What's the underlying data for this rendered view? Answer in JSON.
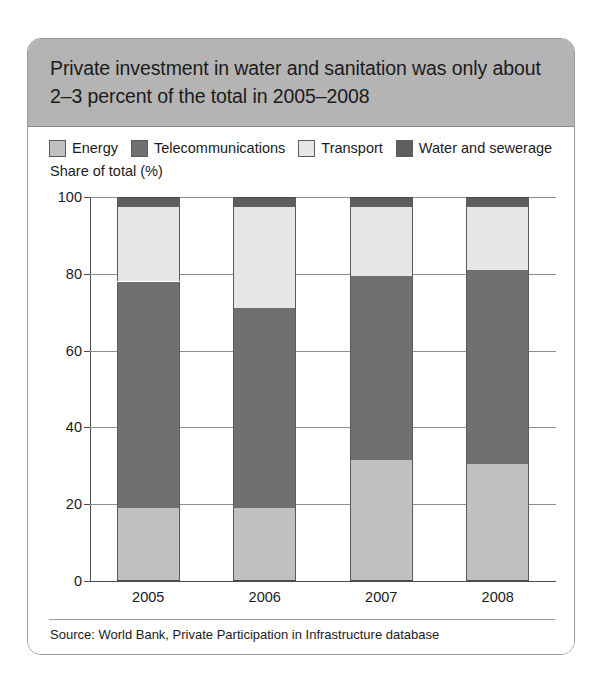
{
  "figure": {
    "title": "Private investment in water and sanitation was only about 2–3 percent of the total in 2005–2008",
    "axis_title": "Share of total (%)",
    "source": "Source: World Bank, Private Participation in Infrastructure database"
  },
  "colors": {
    "header_band": "#b4b4b4",
    "energy": "#c0c0c0",
    "telecommunications": "#707070",
    "transport": "#e6e6e6",
    "water_and_sewerage": "#5e5e5e",
    "card_border": "#9a9a9a",
    "gridline": "#8e8e8e"
  },
  "legend": {
    "items": [
      {
        "label": "Energy",
        "color": "#c0c0c0"
      },
      {
        "label": "Telecommunications",
        "color": "#707070"
      },
      {
        "label": "Transport",
        "color": "#e6e6e6"
      },
      {
        "label": "Water and sewerage",
        "color": "#5e5e5e"
      }
    ]
  },
  "chart_data": {
    "type": "bar",
    "stacked": true,
    "stack_total": 100,
    "title": "Private investment in water and sanitation was only about 2–3 percent of the total in 2005–2008",
    "xlabel": "",
    "ylabel": "Share of total (%)",
    "ylim": [
      0,
      100
    ],
    "yticks": [
      0,
      20,
      40,
      60,
      80,
      100
    ],
    "ytick_labels": [
      "0",
      "20",
      "40",
      "60",
      "80",
      "100"
    ],
    "grid": true,
    "legend_position": "top",
    "categories": [
      "2005",
      "2006",
      "2007",
      "2008"
    ],
    "series": [
      {
        "name": "Energy",
        "color": "#c0c0c0",
        "values": [
          19.0,
          19.0,
          31.5,
          30.5
        ]
      },
      {
        "name": "Telecommunications",
        "color": "#707070",
        "values": [
          59.0,
          52.0,
          48.0,
          50.5
        ]
      },
      {
        "name": "Transport",
        "color": "#e6e6e6",
        "values": [
          19.5,
          26.5,
          18.0,
          16.5
        ]
      },
      {
        "name": "Water and sewerage",
        "color": "#5e5e5e",
        "values": [
          2.5,
          2.5,
          2.5,
          2.5
        ]
      }
    ],
    "source": "Source: World Bank, Private Participation in Infrastructure database"
  }
}
